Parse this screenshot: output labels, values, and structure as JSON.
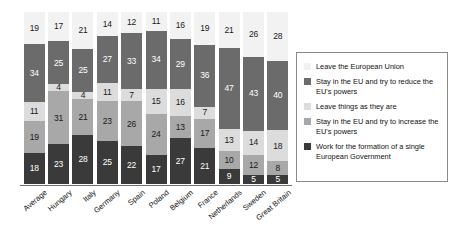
{
  "chart_data": {
    "type": "bar",
    "subtype": "stacked-100-percent",
    "title": "",
    "xlabel": "",
    "ylabel": "",
    "ylim": [
      0,
      100
    ],
    "grid": false,
    "legend_position": "right",
    "categories": [
      "Average",
      "Hungary",
      "Italy",
      "Germany",
      "Spain",
      "Poland",
      "Belgium",
      "France",
      "Netherlands",
      "Sweden",
      "Great Britain"
    ],
    "series": [
      {
        "name": "Leave the European Union",
        "color": "#f2f2f2",
        "values": [
          19,
          17,
          21,
          14,
          12,
          11,
          16,
          19,
          21,
          26,
          28
        ]
      },
      {
        "name": "Stay in the EU and try to reduce the EU's powers",
        "color": "#6b6b6b",
        "values": [
          34,
          25,
          25,
          27,
          33,
          34,
          29,
          36,
          47,
          43,
          40
        ]
      },
      {
        "name": "Leave things as they are",
        "color": "#dcdcdc",
        "values": [
          11,
          4,
          4,
          11,
          7,
          15,
          16,
          7,
          13,
          14,
          18
        ]
      },
      {
        "name": "Stay in the EU and try to increase the EU's powers",
        "color": "#a8a8a8",
        "values": [
          19,
          31,
          21,
          23,
          26,
          24,
          13,
          17,
          10,
          12,
          8
        ]
      },
      {
        "name": "Work for the formation of a single European Government",
        "color": "#3a3a3a",
        "values": [
          18,
          23,
          28,
          25,
          22,
          17,
          27,
          21,
          9,
          5,
          5
        ]
      }
    ]
  },
  "legend": {
    "items": [
      {
        "label": "Leave the European Union",
        "swatch": "legend-swatch-leave-eu"
      },
      {
        "label": "Stay in the EU and try to reduce the EU's powers",
        "swatch": "legend-swatch-reduce-powers"
      },
      {
        "label": "Leave things as they are",
        "swatch": "legend-swatch-leave-as-is"
      },
      {
        "label": "Stay in the EU and try to increase the EU's powers",
        "swatch": "legend-swatch-increase-powers"
      },
      {
        "label": "Work for the formation of a single European Government",
        "swatch": "legend-swatch-single-government"
      }
    ]
  }
}
